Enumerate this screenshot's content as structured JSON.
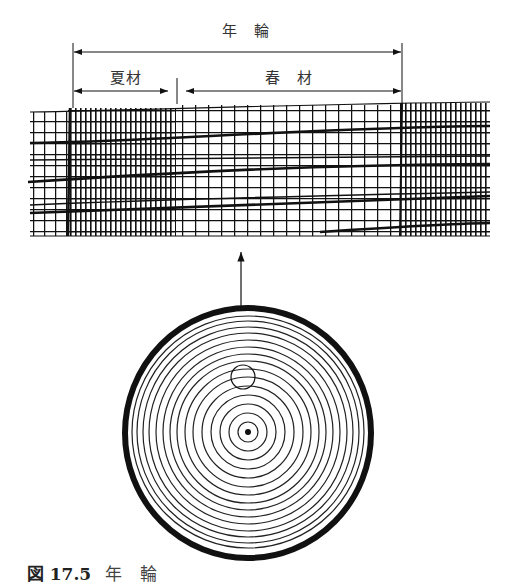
{
  "figure": {
    "caption_label": "図 17.5",
    "caption_text": "年 輪",
    "dimension_labels": {
      "annual_ring": "年　輪",
      "latewood": "夏材",
      "earlywood": "春　材"
    },
    "colors": {
      "ink": "#111111",
      "background": "#ffffff"
    },
    "elements": [
      "dimension-arrow-annual-ring",
      "dimension-arrow-latewood",
      "dimension-arrow-earlywood",
      "wood-cell-strip",
      "pointer-arrow",
      "magnified-region-circle",
      "log-cross-section",
      "pith-dot"
    ]
  }
}
